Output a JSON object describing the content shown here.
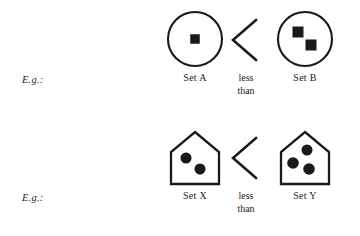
{
  "page": {
    "background_color": "#ffffff",
    "ink_color": "#1a1a1a"
  },
  "rows": [
    {
      "id": "row-circles",
      "eg_label": "E.g.:",
      "left": {
        "container_shape": "circle",
        "label": "Set A",
        "element_shape": "square",
        "element_count": 1,
        "elements": [
          {
            "cx": 31,
            "cy": 31,
            "size": 9.5,
            "rotation": 0
          }
        ]
      },
      "comparison": {
        "symbol": "<",
        "text_line1": "less",
        "text_line2": "than"
      },
      "right": {
        "container_shape": "circle",
        "label": "Set B",
        "element_shape": "square",
        "element_count": 2,
        "elements": [
          {
            "cx": 24,
            "cy": 24,
            "size": 11,
            "rotation": 0
          },
          {
            "cx": 37,
            "cy": 37,
            "size": 11,
            "rotation": 0
          }
        ]
      }
    },
    {
      "id": "row-pentagons",
      "eg_label": "E.g.:",
      "left": {
        "container_shape": "pentagon-house",
        "label": "Set X",
        "element_shape": "circle",
        "element_count": 2,
        "elements": [
          {
            "cx": 22,
            "cy": 32,
            "size": 11
          },
          {
            "cx": 36,
            "cy": 43,
            "size": 11
          }
        ]
      },
      "comparison": {
        "symbol": "<",
        "text_line1": "less",
        "text_line2": "than"
      },
      "right": {
        "container_shape": "pentagon-house",
        "label": "Set Y",
        "element_shape": "circle",
        "element_count": 3,
        "elements": [
          {
            "cx": 33,
            "cy": 24,
            "size": 11
          },
          {
            "cx": 19,
            "cy": 37,
            "size": 11.5
          },
          {
            "cx": 35,
            "cy": 43,
            "size": 11.5
          }
        ]
      }
    }
  ]
}
